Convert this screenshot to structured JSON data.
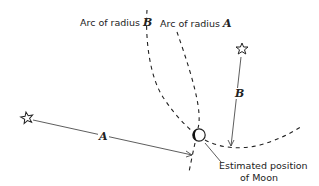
{
  "diagram": {
    "labels": {
      "arc_b_prefix": "Arc of radius ",
      "arc_b_var": "B",
      "arc_a_prefix": "Arc of radius ",
      "arc_a_var": "A",
      "distance_a": "A",
      "distance_b": "B",
      "moon_note_line1": "Estimated position",
      "moon_note_line2": "of Moon"
    },
    "elements": {
      "star_left": {
        "icon": "star-outline-icon",
        "x": 27,
        "y": 118
      },
      "star_right": {
        "icon": "star-outline-icon",
        "x": 241,
        "y": 48
      },
      "moon": {
        "icon": "moon-crescent-icon",
        "x": 198,
        "y": 135,
        "r": 6
      }
    },
    "colors": {
      "ink": "#222222",
      "background": "#ffffff"
    }
  }
}
